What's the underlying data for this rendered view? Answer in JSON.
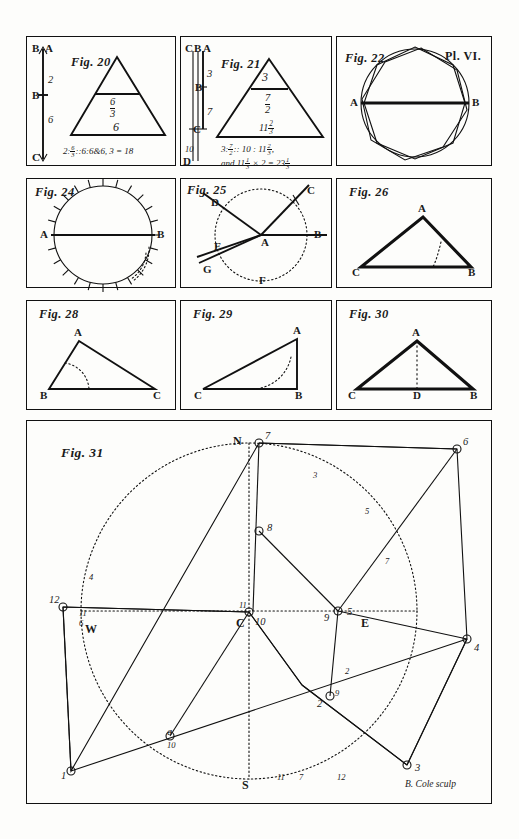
{
  "plate": {
    "label": "Pl. VI.",
    "engraver_signature": "B. Cole sculp"
  },
  "figures": [
    {
      "id": "fig20",
      "title": "Fig. 20",
      "type": "triangle-with-parallel-line-and-scale",
      "scale_labels": [
        "B",
        "A",
        "2",
        "B",
        "6",
        "C"
      ],
      "inside_labels": [
        "6",
        "3",
        "6"
      ],
      "equation": "2 : 6⁄3 :: 6 : 6 & 6 , 3 = 18",
      "equation_plain": "2:6/3::6:6&6, 3=18"
    },
    {
      "id": "fig21",
      "title": "Fig. 21",
      "type": "triangle-with-parallel-line-and-scale",
      "scale_labels": [
        "C",
        "B",
        "A",
        "3",
        "B",
        "7",
        "C",
        "10",
        "D"
      ],
      "inside_labels": [
        "3",
        "7/2",
        "11 2/3"
      ],
      "equation_line1": "3 : 7⁄2 :: 10 : 11 2⁄3 ,",
      "equation_line2": "and 11 2⁄3 × 2 = 23 1⁄3"
    },
    {
      "id": "fig22",
      "title": "Fig. 22",
      "type": "circle-with-inscribed-and-circumscribed-polygon",
      "point_labels": [
        "A",
        "B"
      ]
    },
    {
      "id": "fig24",
      "title": "Fig. 24",
      "type": "graduated-circle-with-diameter",
      "point_labels": [
        "A",
        "B"
      ],
      "tick_count": 24
    },
    {
      "id": "fig25",
      "title": "Fig. 25",
      "type": "dotted-circle-with-rays-from-center",
      "point_labels": [
        "A",
        "B",
        "C",
        "D",
        "E",
        "F",
        "G"
      ]
    },
    {
      "id": "fig26",
      "title": "Fig. 26",
      "type": "triangle-with-dotted-arc",
      "point_labels": [
        "A",
        "B",
        "C"
      ]
    },
    {
      "id": "fig28",
      "title": "Fig. 28",
      "type": "triangle-with-dotted-arc",
      "point_labels": [
        "A",
        "B",
        "C"
      ]
    },
    {
      "id": "fig29",
      "title": "Fig. 29",
      "type": "right-triangle-with-dotted-arc",
      "point_labels": [
        "A",
        "B",
        "C"
      ]
    },
    {
      "id": "fig30",
      "title": "Fig. 30",
      "type": "triangle-with-altitude",
      "point_labels": [
        "A",
        "B",
        "C",
        "D"
      ]
    },
    {
      "id": "fig31",
      "title": "Fig. 31",
      "type": "surveying-plot-with-compass-circle",
      "compass_labels": [
        "N",
        "S",
        "E",
        "W"
      ],
      "center_label": "C",
      "station_numbers": [
        "1",
        "2",
        "3",
        "4",
        "6",
        "7",
        "8",
        "9",
        "10",
        "11",
        "12"
      ],
      "bearing_numbers": [
        "1",
        "2",
        "3",
        "4",
        "5",
        "6",
        "7",
        "8",
        "9",
        "10",
        "11",
        "12"
      ]
    }
  ]
}
